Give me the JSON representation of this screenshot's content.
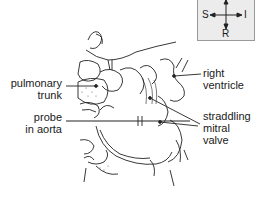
{
  "figure": {
    "labels": {
      "pulmonary_trunk": [
        "pulmonary",
        "trunk"
      ],
      "probe_in_aorta": [
        "probe",
        "in aorta"
      ],
      "right_ventricle": [
        "right",
        "ventricle"
      ],
      "straddling_mitral_valve": [
        "straddling",
        "mitral",
        "valve"
      ]
    },
    "orientation": {
      "left": "S",
      "right": "I",
      "bottom": "R"
    }
  }
}
